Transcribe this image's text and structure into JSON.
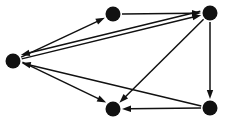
{
  "diagram": {
    "type": "directed-graph",
    "canvas": {
      "width": 226,
      "height": 124,
      "background": "#ffffff"
    },
    "style": {
      "node_color": "#111111",
      "node_radius": 7.5,
      "edge_color": "#111111",
      "edge_width": 1.5,
      "arrowhead_length": 9,
      "arrowhead_half_width": 3.2
    },
    "nodes": [
      {
        "id": "left",
        "label": "",
        "cx": 13,
        "cy": 61,
        "r": 7.5
      },
      {
        "id": "top-middle",
        "label": "",
        "cx": 113,
        "cy": 14,
        "r": 7.5
      },
      {
        "id": "top-right",
        "label": "",
        "cx": 210,
        "cy": 13,
        "r": 7.5
      },
      {
        "id": "bottom-middle",
        "label": "",
        "cx": 113,
        "cy": 109,
        "r": 7.5
      },
      {
        "id": "bottom-right",
        "label": "",
        "cx": 210,
        "cy": 108,
        "r": 7.5
      }
    ],
    "edges": [
      {
        "id": "e1",
        "from": "left",
        "to": "top-middle",
        "directed": true
      },
      {
        "id": "e2",
        "from": "top-middle",
        "to": "top-right",
        "directed": true
      },
      {
        "id": "e3",
        "from": "left",
        "to": "top-right",
        "directed": true
      },
      {
        "id": "e4",
        "from": "top-right",
        "to": "left",
        "directed": true,
        "offset": 4
      },
      {
        "id": "e5",
        "from": "top-right",
        "to": "bottom-middle",
        "directed": true
      },
      {
        "id": "e6",
        "from": "top-right",
        "to": "bottom-right",
        "directed": true
      },
      {
        "id": "e7",
        "from": "bottom-right",
        "to": "left",
        "directed": true
      },
      {
        "id": "e8",
        "from": "bottom-right",
        "to": "bottom-middle",
        "directed": true
      },
      {
        "id": "e9",
        "from": "left",
        "to": "bottom-middle",
        "directed": true,
        "offset": -3
      }
    ]
  }
}
